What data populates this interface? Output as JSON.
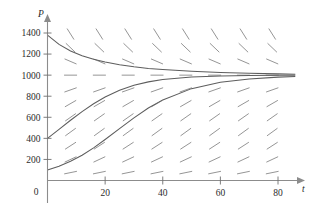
{
  "chart_data": {
    "type": "line",
    "title": "",
    "subtitle": "",
    "xlabel": "t",
    "ylabel": "P",
    "xlim": [
      -3,
      88
    ],
    "ylim": [
      0,
      1500
    ],
    "xticks": [
      20,
      40,
      60,
      80
    ],
    "xtick_labels": [
      "20",
      "40",
      "60",
      "80"
    ],
    "yticks": [
      200,
      400,
      600,
      800,
      1000,
      1200,
      1400
    ],
    "ytick_labels": [
      "200",
      "400",
      "600",
      "800",
      "1000",
      "1200",
      "1400"
    ],
    "origin_label": "0",
    "grid": false,
    "legend": null,
    "equilibrium": 1000,
    "carrying_capacity": 1000,
    "growth_rate": 0.08,
    "slope_field": {
      "t_positions": [
        8,
        18,
        28,
        38,
        48,
        58,
        68,
        78
      ],
      "p_positions": [
        75,
        200,
        330,
        460,
        600,
        730,
        860,
        1000,
        1130,
        1260,
        1390
      ],
      "segment_length_px": 13,
      "color": "#8f8f8f"
    },
    "series": [
      {
        "name": "solution-upper",
        "initial_value": 1380,
        "points_t": [
          0,
          4,
          8,
          12,
          16,
          20,
          25,
          30,
          35,
          40,
          50,
          60,
          70,
          80,
          86
        ],
        "points_p": [
          1380,
          1292,
          1229,
          1184,
          1150,
          1124,
          1098,
          1079,
          1064,
          1053,
          1037,
          1026,
          1018,
          1012,
          1009
        ]
      },
      {
        "name": "solution-middle",
        "initial_value": 400,
        "points_t": [
          0,
          4,
          8,
          12,
          16,
          20,
          25,
          30,
          35,
          40,
          50,
          60,
          70,
          80,
          86
        ],
        "points_p": [
          400,
          485,
          572,
          654,
          728,
          792,
          856,
          903,
          936,
          958,
          982,
          992,
          996,
          998,
          999
        ]
      },
      {
        "name": "solution-lower",
        "initial_value": 100,
        "points_t": [
          0,
          4,
          8,
          12,
          16,
          20,
          25,
          30,
          35,
          40,
          50,
          60,
          70,
          80,
          86
        ],
        "points_p": [
          100,
          136,
          182,
          240,
          310,
          389,
          492,
          595,
          688,
          765,
          872,
          932,
          964,
          981,
          988
        ]
      }
    ]
  },
  "axes": {
    "y_axis_name": "P",
    "x_axis_name": "t",
    "origin": "0"
  },
  "labels": {
    "y": [
      "1400",
      "1200",
      "1000",
      "800",
      "600",
      "400",
      "200"
    ],
    "x": [
      "20",
      "40",
      "60",
      "80"
    ]
  }
}
